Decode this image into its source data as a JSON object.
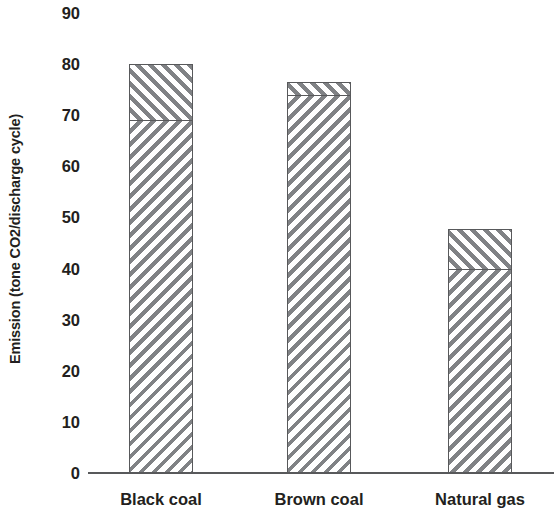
{
  "chart_data": {
    "type": "bar",
    "title": "",
    "subtitle": "",
    "xlabel": "",
    "ylabel": "Emission (tone CO2/discharge cycle)",
    "categories": [
      "Black coal",
      "Brown coal",
      "Natural gas"
    ],
    "ylim": [
      0,
      90
    ],
    "yticks": [
      0,
      10,
      20,
      30,
      40,
      50,
      60,
      70,
      80,
      90
    ],
    "ytick_labels": [
      "0",
      "10",
      "20",
      "30",
      "40",
      "50",
      "60",
      "70",
      "80",
      "90"
    ],
    "grid": false,
    "legend": false,
    "legend_position": "none",
    "stacked": true,
    "series": [
      {
        "name": "lower segment",
        "values": [
          69,
          74,
          40
        ]
      },
      {
        "name": "upper segment",
        "values": [
          11,
          2.5,
          7.7
        ]
      }
    ],
    "totals": [
      80,
      76.5,
      47.7
    ],
    "annotations": [],
    "colors": {
      "hatch_stroke": "#808285",
      "bar_fill": "#ffffff",
      "bar_outline": "#58595b",
      "axis": "#58595b",
      "text": "#231f20"
    }
  }
}
